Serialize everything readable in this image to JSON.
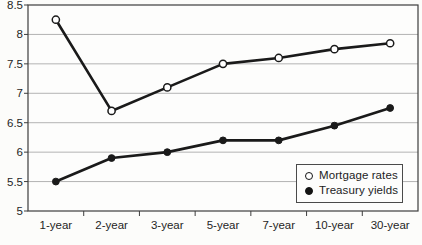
{
  "figure": {
    "background": "#fcfcfa",
    "colors": {
      "line": "#1a1a1a",
      "grid": "#b3b3b3",
      "axis": "#3d3d3d",
      "text": "#1f1f1f",
      "plot_bg": "#fdfdfc"
    }
  },
  "chart_data": {
    "type": "line",
    "title": "",
    "xlabel": "",
    "ylabel": "",
    "categories": [
      "1-year",
      "2-year",
      "3-year",
      "5-year",
      "7-year",
      "10-year",
      "30-year"
    ],
    "series": [
      {
        "name": "Mortgage rates",
        "marker": "open-circle",
        "values": [
          8.25,
          6.7,
          7.1,
          7.5,
          7.6,
          7.75,
          7.85
        ]
      },
      {
        "name": "Treasury yields",
        "marker": "filled-circle",
        "values": [
          5.5,
          5.9,
          6.0,
          6.2,
          6.2,
          6.45,
          6.75
        ]
      }
    ],
    "ylim": [
      5,
      8.5
    ],
    "y_ticks": [
      8.5,
      8,
      7.5,
      7,
      6.5,
      6,
      5.5,
      5
    ],
    "y_tick_labels": [
      "8.5",
      "8",
      "7.5",
      "7",
      "6.5",
      "6",
      "5.5",
      "5"
    ],
    "grid": "horizontal",
    "legend_position": "inside-bottom-right",
    "plot_border": true
  }
}
